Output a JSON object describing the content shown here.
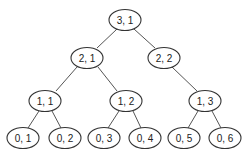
{
  "diagram": {
    "type": "tree",
    "colors": {
      "stroke": "#333333",
      "fill": "#ffffff",
      "text": "#222222"
    },
    "nodes": [
      {
        "id": "n31",
        "label": "3, 1",
        "cx": 125,
        "cy": 20
      },
      {
        "id": "n21",
        "label": "2, 1",
        "cx": 87,
        "cy": 58
      },
      {
        "id": "n22",
        "label": "2, 2",
        "cx": 164,
        "cy": 58
      },
      {
        "id": "n11",
        "label": "1, 1",
        "cx": 45,
        "cy": 101
      },
      {
        "id": "n12",
        "label": "1, 2",
        "cx": 126,
        "cy": 101
      },
      {
        "id": "n13",
        "label": "1, 3",
        "cx": 205,
        "cy": 101
      },
      {
        "id": "n01",
        "label": "0, 1",
        "cx": 23,
        "cy": 138
      },
      {
        "id": "n02",
        "label": "0, 2",
        "cx": 65,
        "cy": 138
      },
      {
        "id": "n03",
        "label": "0, 3",
        "cx": 104,
        "cy": 138
      },
      {
        "id": "n04",
        "label": "0, 4",
        "cx": 145,
        "cy": 138
      },
      {
        "id": "n05",
        "label": "0, 5",
        "cx": 184,
        "cy": 138
      },
      {
        "id": "n06",
        "label": "0, 6",
        "cx": 225,
        "cy": 138
      }
    ],
    "edges": [
      [
        "n31",
        "n21"
      ],
      [
        "n31",
        "n22"
      ],
      [
        "n21",
        "n11"
      ],
      [
        "n21",
        "n12"
      ],
      [
        "n22",
        "n13"
      ],
      [
        "n11",
        "n01"
      ],
      [
        "n11",
        "n02"
      ],
      [
        "n12",
        "n03"
      ],
      [
        "n12",
        "n04"
      ],
      [
        "n13",
        "n05"
      ],
      [
        "n13",
        "n06"
      ]
    ]
  }
}
